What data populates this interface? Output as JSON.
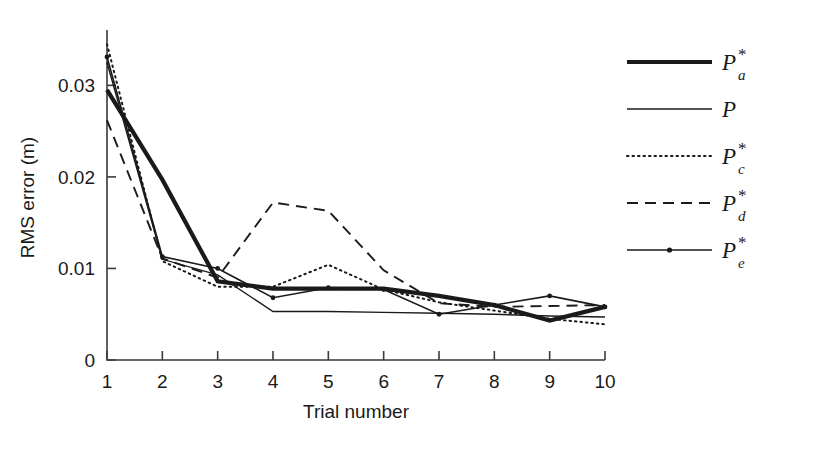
{
  "figure": {
    "background": "#ffffff",
    "ink_color": "#1a1a1a"
  },
  "axes": {
    "x_title": "Trial number",
    "y_title": "RMS error (m)",
    "x_ticks": [
      "1",
      "2",
      "3",
      "4",
      "5",
      "6",
      "7",
      "8",
      "9",
      "10"
    ],
    "y_ticks": [
      "0",
      "0.01",
      "0.02",
      "0.03"
    ]
  },
  "legend": {
    "entries": [
      {
        "name": "P-a-star",
        "base": "P",
        "sub": "a",
        "star": "*",
        "style": "thick-solid"
      },
      {
        "name": "P-plain",
        "base": "P",
        "sub": "",
        "star": "",
        "style": "thin-solid"
      },
      {
        "name": "P-c-star",
        "base": "P",
        "sub": "c",
        "star": "*",
        "style": "dotted"
      },
      {
        "name": "P-d-star",
        "base": "P",
        "sub": "d",
        "star": "*",
        "style": "dashed"
      },
      {
        "name": "P-e-star",
        "base": "P",
        "sub": "e",
        "star": "*",
        "style": "solid-marker"
      }
    ]
  },
  "chart_data": {
    "type": "line",
    "title": "",
    "xlabel": "Trial number",
    "ylabel": "RMS error (m)",
    "xlim": [
      1,
      10
    ],
    "ylim": [
      0,
      0.0355
    ],
    "xticks": [
      1,
      2,
      3,
      4,
      5,
      6,
      7,
      8,
      9,
      10
    ],
    "yticks": [
      0,
      0.01,
      0.02,
      0.03
    ],
    "grid": false,
    "legend_position": "upper-right-outside",
    "x": [
      1,
      2,
      3,
      4,
      5,
      6,
      7,
      8,
      9,
      10
    ],
    "series": [
      {
        "name": "P_a*",
        "label": "P*a",
        "style": "thick-solid",
        "linewidth": 4.2,
        "dash": "none",
        "marker": "none",
        "values": [
          0.0295,
          0.0197,
          0.0086,
          0.0078,
          0.0078,
          0.0078,
          0.007,
          0.006,
          0.0043,
          0.0058
        ]
      },
      {
        "name": "P",
        "label": "P",
        "style": "thin-solid",
        "linewidth": 1.4,
        "dash": "none",
        "marker": "none",
        "values": [
          0.0325,
          0.011,
          0.0093,
          0.0053,
          0.0053,
          0.0052,
          0.0051,
          0.005,
          0.0048,
          0.0047
        ]
      },
      {
        "name": "P_c*",
        "label": "P*c",
        "style": "dotted",
        "linewidth": 2.0,
        "dash": "1.5,4",
        "marker": "none",
        "values": [
          0.0345,
          0.0108,
          0.008,
          0.008,
          0.0104,
          0.0077,
          0.0063,
          0.0054,
          0.0045,
          0.0039
        ]
      },
      {
        "name": "P_d*",
        "label": "P*d",
        "style": "dashed",
        "linewidth": 1.9,
        "dash": "11,7",
        "marker": "none",
        "values": [
          0.0262,
          0.0111,
          0.009,
          0.0172,
          0.0163,
          0.0098,
          0.0062,
          0.0058,
          0.0059,
          0.006
        ]
      },
      {
        "name": "P_e*",
        "label": "P*e",
        "style": "solid-marker",
        "linewidth": 1.6,
        "dash": "none",
        "marker": "dot",
        "values": [
          0.0331,
          0.0113,
          0.01,
          0.0068,
          0.0079,
          0.0077,
          0.005,
          0.006,
          0.007,
          0.0058
        ]
      }
    ]
  }
}
